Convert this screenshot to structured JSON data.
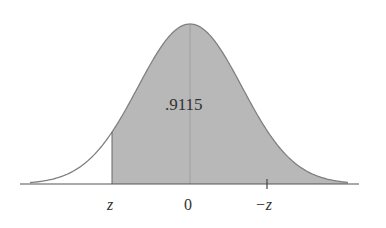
{
  "chart_data": {
    "type": "area",
    "title": "",
    "shaded_area_label": ".9115",
    "tick_labels": [
      "z",
      "0",
      "−z"
    ],
    "shaded_from": "z",
    "shaded_to": "+inf",
    "shaded_area": 0.9115,
    "xlabel": "",
    "ylabel": "",
    "grid": false,
    "colors": {
      "fill": "#b8b8b8",
      "curve": "#808080",
      "axis": "#555555"
    }
  },
  "labels": {
    "area": ".9115",
    "z": "z",
    "zero": "0",
    "neg_z": "−z"
  }
}
